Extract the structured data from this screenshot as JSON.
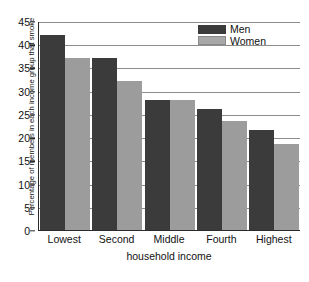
{
  "chart_data": {
    "type": "bar",
    "title": "",
    "xlabel": "household income",
    "ylabel": "Percentage of members in each income group that smoke",
    "categories": [
      "Lowest",
      "Second",
      "Middle",
      "Fourth",
      "Highest"
    ],
    "series": [
      {
        "name": "Men",
        "color": "#3b3b3b",
        "values": [
          42,
          37,
          28,
          26,
          21.5
        ]
      },
      {
        "name": "Women",
        "color": "#9c9c9c",
        "values": [
          37,
          32,
          28,
          23.5,
          18.5
        ]
      }
    ],
    "ylim": [
      0,
      45
    ],
    "yticks": [
      0,
      5,
      10,
      15,
      20,
      25,
      30,
      35,
      40,
      45
    ],
    "ytick_labels": [
      "0",
      "5",
      "10",
      "15",
      "20",
      "25",
      "30",
      "35",
      "40",
      "45"
    ],
    "grid": true,
    "grid_axis": "y",
    "legend_position": "top-right",
    "legend_entries": [
      "Men",
      "Women"
    ]
  }
}
